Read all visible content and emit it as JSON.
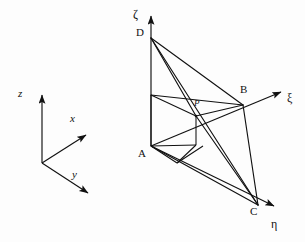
{
  "figure": {
    "kind": "geometry-diagram",
    "background_color": "#fdfdfd",
    "stroke_color": "#111111",
    "width": 305,
    "height": 242
  },
  "global_frame": {
    "name": "global-cartesian-axes",
    "origin": {
      "x": 42,
      "y": 163
    },
    "axes": [
      {
        "id": "z",
        "label": "z",
        "label_x": 18,
        "label_y": 88,
        "tip_x": 42,
        "tip_y": 91
      },
      {
        "id": "x",
        "label": "x",
        "label_x": 70,
        "label_y": 113,
        "tip_x": 89,
        "tip_y": 137
      },
      {
        "id": "y",
        "label": "y",
        "label_x": 72,
        "label_y": 169,
        "tip_x": 91,
        "tip_y": 196
      }
    ]
  },
  "local_frame": {
    "name": "local-curvilinear-axes",
    "origin": {
      "x": 151,
      "y": 146
    },
    "axes": [
      {
        "id": "zeta",
        "label": "ζ",
        "label_x": 133,
        "label_y": 8,
        "tip_x": 151,
        "tip_y": 12
      },
      {
        "id": "xi",
        "label": "ξ",
        "label_x": 287,
        "label_y": 92,
        "tip_x": 285,
        "tip_y": 89
      },
      {
        "id": "eta",
        "label": "η",
        "label_x": 271,
        "label_y": 218,
        "tip_x": 278,
        "tip_y": 208
      }
    ]
  },
  "vertices": [
    {
      "id": "A",
      "label": "A",
      "x": 151,
      "y": 146,
      "label_x": 138,
      "label_y": 148
    },
    {
      "id": "B",
      "label": "B",
      "x": 243,
      "y": 105,
      "label_x": 240,
      "label_y": 84
    },
    {
      "id": "C",
      "label": "C",
      "x": 258,
      "y": 205,
      "label_x": 250,
      "label_y": 206
    },
    {
      "id": "D",
      "label": "D",
      "x": 151,
      "y": 38,
      "label_x": 136,
      "label_y": 27
    },
    {
      "id": "P",
      "label": "P",
      "x": 196,
      "y": 115,
      "label_x": 194,
      "label_y": 98
    }
  ],
  "edges": [
    {
      "name": "edge-D-B",
      "from": "D",
      "to": "B"
    },
    {
      "name": "edge-D-C",
      "from": "D",
      "to": "C"
    },
    {
      "name": "edge-D-P",
      "from": "D",
      "to": "P"
    },
    {
      "name": "edge-D-A",
      "from": "D",
      "to": "A"
    },
    {
      "name": "edge-A-C",
      "from": "A",
      "to": "C"
    },
    {
      "name": "edge-B-C",
      "from": "B",
      "to": "C"
    },
    {
      "name": "edge-P-C",
      "from": "P",
      "to": "C"
    },
    {
      "name": "edge-P-B",
      "from": "P",
      "to": "B"
    }
  ],
  "inner_box": {
    "name": "reference-parallelepiped",
    "top_face": [
      {
        "x": 151,
        "y": 95
      },
      {
        "x": 196,
        "y": 95
      },
      {
        "x": 196,
        "y": 115
      },
      {
        "x": 151,
        "y": 95
      }
    ],
    "base_face": [
      {
        "x": 151,
        "y": 146
      },
      {
        "x": 177,
        "y": 163
      },
      {
        "x": 203,
        "y": 146
      },
      {
        "x": 196,
        "y": 142
      }
    ]
  },
  "caption": ""
}
